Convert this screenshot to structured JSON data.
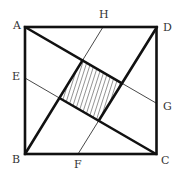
{
  "diagram": {
    "colors": {
      "stroke": "#111111",
      "thin_stroke": "#333333",
      "hatch": "#777777",
      "label": "#333333",
      "background": "#ffffff"
    },
    "points": {
      "A": {
        "label": "A",
        "x": 25,
        "y": 27
      },
      "B": {
        "label": "B",
        "x": 25,
        "y": 154
      },
      "C": {
        "label": "C",
        "x": 156,
        "y": 154
      },
      "D": {
        "label": "D",
        "x": 157,
        "y": 27
      },
      "E": {
        "label": "E",
        "x": 25,
        "y": 78
      },
      "F": {
        "label": "F",
        "x": 78,
        "y": 154
      },
      "G": {
        "label": "G",
        "x": 156,
        "y": 103
      },
      "H": {
        "label": "H",
        "x": 103,
        "y": 27
      }
    },
    "labels": {
      "A": "A",
      "B": "B",
      "C": "C",
      "D": "D",
      "E": "E",
      "F": "F",
      "G": "G",
      "H": "H"
    },
    "segments": [
      {
        "from": "A",
        "to": "G",
        "thick_portion": "A to inner-top"
      },
      {
        "from": "E",
        "to": "C",
        "thick_portion": "inner-left to C"
      },
      {
        "from": "B",
        "to": "H",
        "thick_portion": "B to inner-top"
      },
      {
        "from": "F",
        "to": "D",
        "thick_portion": "inner-bottom to D"
      }
    ],
    "inner_square": {
      "hatched": true,
      "vertices": [
        {
          "name": "top",
          "x": 82.5,
          "y": 60.4
        },
        {
          "name": "right",
          "x": 122,
          "y": 83.3
        },
        {
          "name": "bottom",
          "x": 98.7,
          "y": 120.7
        },
        {
          "name": "left",
          "x": 59.4,
          "y": 98.0
        }
      ]
    }
  }
}
